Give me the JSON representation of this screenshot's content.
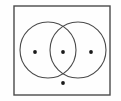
{
  "figure": {
    "type": "venn-diagram",
    "background_color": "#fefefe",
    "stroke_color": "#4a4a4a",
    "dot_color": "#1a1a1a",
    "canvas": {
      "width": 121,
      "height": 101
    }
  },
  "universal_set": {
    "label": "",
    "shape": "rectangle",
    "x": 14,
    "y": 6,
    "width": 96,
    "height": 89,
    "stroke_width": 1.4,
    "fill": "none"
  },
  "circles": [
    {
      "name": "left-circle",
      "label": "",
      "cx": 48,
      "cy": 50,
      "r": 28,
      "stroke_width": 1.1,
      "fill": "none"
    },
    {
      "name": "right-circle",
      "label": "",
      "cx": 78,
      "cy": 50,
      "r": 28,
      "stroke_width": 1.1,
      "fill": "none"
    }
  ],
  "points": [
    {
      "name": "point-left-only",
      "region": "left-only",
      "cx": 35,
      "cy": 52,
      "r": 1.9,
      "label": ""
    },
    {
      "name": "point-intersection",
      "region": "intersection",
      "cx": 63,
      "cy": 52,
      "r": 1.9,
      "label": ""
    },
    {
      "name": "point-right-only",
      "region": "right-only",
      "cx": 91,
      "cy": 52,
      "r": 1.9,
      "label": ""
    },
    {
      "name": "point-outside-circles",
      "region": "outside-both-inside-universal",
      "cx": 63,
      "cy": 83,
      "r": 1.9,
      "label": ""
    }
  ],
  "chart_data": {
    "type": "venn",
    "title": "",
    "sets": [
      "A",
      "B"
    ],
    "regions": [
      {
        "region": "A only",
        "count": 1
      },
      {
        "region": "A and B",
        "count": 1
      },
      {
        "region": "B only",
        "count": 1
      },
      {
        "region": "neither (universal set only)",
        "count": 1
      }
    ],
    "total_elements": 4,
    "legend": [],
    "grid": false
  }
}
